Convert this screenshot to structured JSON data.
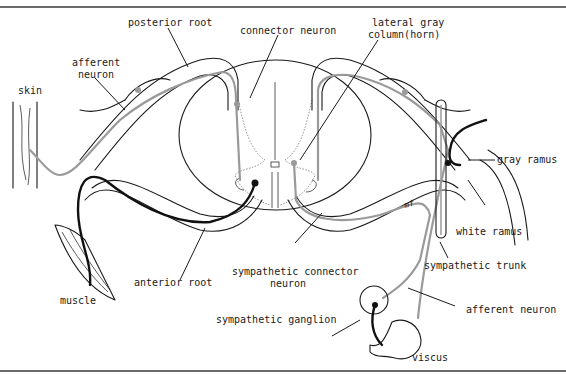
{
  "diagram": {
    "colors": {
      "ink": "#1a1a1a",
      "afferent_gray": "#9a9a9a",
      "efferent_black": "#111111",
      "rule": "#6b6b6b"
    },
    "labels": {
      "posterior_root": "posterior root",
      "connector_neuron": "connector neuron",
      "lateral_gray_line1": "lateral gray",
      "lateral_gray_line2": "column(horn)",
      "afferent_neuron_line1": "afferent",
      "afferent_neuron_line2": "neuron",
      "skin": "skin",
      "gray_ramus": "gray ramus",
      "white_ramus": "white ramus",
      "sympathetic_trunk": "sympathetic trunk",
      "muscle": "muscle",
      "anterior_root": "anterior root",
      "sympathetic_connector_line1": "sympathetic connector",
      "sympathetic_connector_line2": "neuron",
      "sympathetic_ganglion": "sympathetic ganglion",
      "afferent_neuron_right": "afferent neuron",
      "viscus": "viscus",
      "mf_mark": "mf"
    }
  }
}
